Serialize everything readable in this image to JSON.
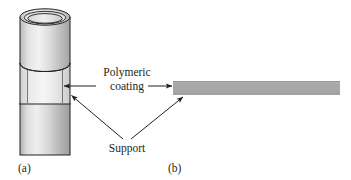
{
  "figure": {
    "panels": [
      {
        "id": "a",
        "label": "(a)",
        "geometry": "tubular-support",
        "x": 18,
        "y": 161
      },
      {
        "id": "b",
        "label": "(b)",
        "geometry": "flat-sheet-support",
        "x": 168,
        "y": 161
      }
    ],
    "callouts": [
      {
        "name": "polymeric-coating",
        "line1": "Polymeric",
        "line2": "coating"
      },
      {
        "name": "support",
        "line1": "Support"
      }
    ],
    "colors": {
      "ink": "#231f20",
      "coating_fill": "#a8a8a8",
      "support_light": "#e8e8e8",
      "support_mid": "#c9c9c9",
      "support_dark": "#9a9a9a",
      "background": "#ffffff"
    }
  }
}
